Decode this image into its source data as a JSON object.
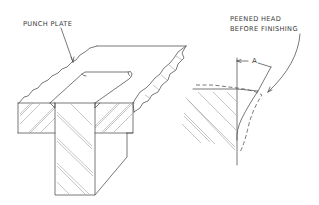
{
  "diagram": {
    "type": "technical-drawing",
    "labels": {
      "punch_plate": "PUNCH PLATE",
      "peened_line1": "PEENED HEAD",
      "peened_line2": "BEFORE FINISHING",
      "dimension": "A"
    },
    "colors": {
      "line": "#555555",
      "hatch": "#b8b8b8",
      "text": "#3a3a3a",
      "background": "#ffffff"
    }
  }
}
